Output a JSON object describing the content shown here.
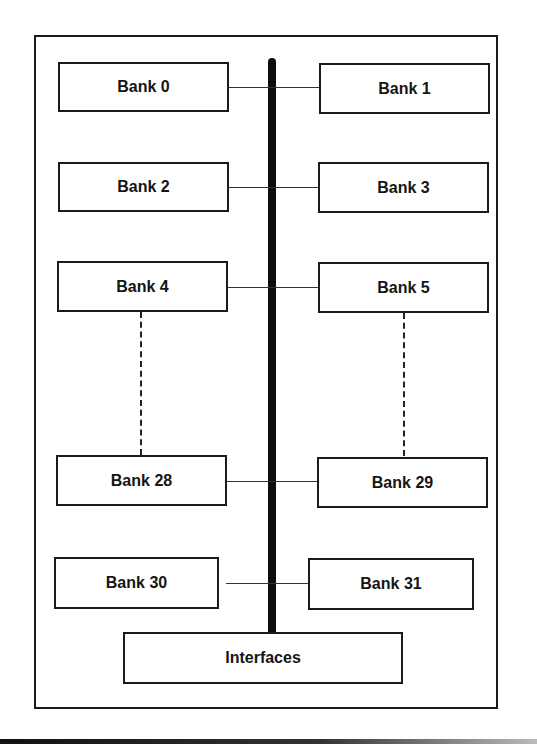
{
  "diagram": {
    "type": "memory-bank-bus-architecture",
    "banks_left": [
      {
        "id": "bank-0",
        "label": "Bank 0"
      },
      {
        "id": "bank-2",
        "label": "Bank 2"
      },
      {
        "id": "bank-4",
        "label": "Bank 4"
      },
      {
        "id": "bank-28",
        "label": "Bank 28"
      },
      {
        "id": "bank-30",
        "label": "Bank 30"
      }
    ],
    "banks_right": [
      {
        "id": "bank-1",
        "label": "Bank 1"
      },
      {
        "id": "bank-3",
        "label": "Bank 3"
      },
      {
        "id": "bank-5",
        "label": "Bank 5"
      },
      {
        "id": "bank-29",
        "label": "Bank 29"
      },
      {
        "id": "bank-31",
        "label": "Bank 31"
      }
    ],
    "interfaces": {
      "label": "Interfaces"
    },
    "ellipsis": "dashed lines indicate Banks 6–27 omitted",
    "colors": {
      "line": "#1a1a1a",
      "bus": "#0d0d0d",
      "background": "#ffffff"
    }
  }
}
